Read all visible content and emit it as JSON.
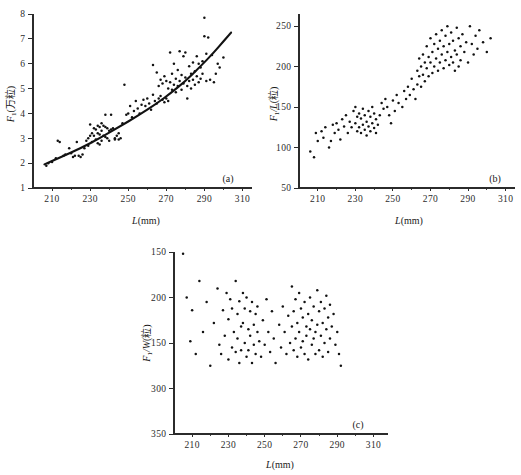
{
  "figure": {
    "background": "#ffffff",
    "ink_color": "#121212",
    "panels": [
      "a",
      "b",
      "c"
    ]
  },
  "chart_data": [
    {
      "type": "scatter",
      "panel_label": "(a)",
      "title": "",
      "xlabel": "L(mm)",
      "ylabel": "F₁(万粒)",
      "xlim": [
        200,
        315
      ],
      "ylim": [
        1,
        8
      ],
      "xticks": [
        210,
        230,
        250,
        270,
        290,
        310
      ],
      "yticks": [
        1,
        2,
        3,
        4,
        5,
        6,
        7,
        8
      ],
      "grid": false,
      "legend": "none",
      "has_fit_curve": true,
      "fit_curve_description": "monotonic increasing convex curve from about (206, 1.95) to (304, 7.25)",
      "fit_curve_points": [
        [
          206,
          1.95
        ],
        [
          215,
          2.25
        ],
        [
          225,
          2.6
        ],
        [
          235,
          3.0
        ],
        [
          245,
          3.45
        ],
        [
          255,
          3.9
        ],
        [
          265,
          4.4
        ],
        [
          272,
          4.8
        ],
        [
          280,
          5.3
        ],
        [
          288,
          5.9
        ],
        [
          295,
          6.45
        ],
        [
          300,
          6.9
        ],
        [
          304,
          7.25
        ]
      ],
      "x": [
        207,
        208,
        210,
        212,
        213,
        214,
        216,
        217,
        219,
        220,
        221,
        222,
        223,
        224,
        225,
        226,
        227,
        228,
        229,
        229,
        230,
        230,
        231,
        231,
        232,
        232,
        233,
        233,
        234,
        234,
        234,
        235,
        235,
        235,
        236,
        236,
        236,
        237,
        237,
        238,
        238,
        238,
        239,
        239,
        240,
        240,
        241,
        241,
        242,
        243,
        243,
        244,
        245,
        245,
        246,
        247,
        248,
        249,
        250,
        251,
        252,
        253,
        254,
        255,
        256,
        257,
        258,
        259,
        260,
        261,
        262,
        263,
        263,
        264,
        265,
        265,
        266,
        266,
        267,
        267,
        268,
        268,
        269,
        269,
        270,
        270,
        271,
        271,
        272,
        272,
        273,
        273,
        274,
        274,
        275,
        275,
        276,
        276,
        277,
        277,
        278,
        278,
        279,
        279,
        280,
        280,
        281,
        281,
        282,
        282,
        283,
        283,
        284,
        284,
        285,
        285,
        286,
        286,
        287,
        287,
        288,
        288,
        289,
        289,
        290,
        290,
        291,
        291,
        292,
        293,
        294,
        295,
        296,
        297,
        298,
        300
      ],
      "y": [
        1.9,
        2.0,
        2.05,
        2.2,
        2.9,
        2.85,
        2.3,
        2.35,
        2.6,
        2.4,
        2.25,
        2.3,
        2.85,
        2.3,
        2.25,
        2.35,
        2.6,
        2.9,
        3.0,
        2.7,
        3.55,
        3.1,
        3.2,
        2.85,
        3.4,
        3.1,
        3.35,
        2.95,
        3.5,
        3.2,
        2.8,
        3.45,
        3.15,
        2.75,
        3.6,
        3.3,
        2.9,
        3.5,
        3.1,
        3.95,
        3.45,
        3.05,
        3.4,
        3.0,
        3.3,
        2.9,
        3.95,
        3.35,
        3.4,
        3.0,
        2.95,
        3.1,
        3.2,
        2.95,
        3.0,
        3.6,
        5.15,
        3.95,
        4.0,
        4.3,
        3.85,
        4.1,
        4.5,
        4.2,
        4.0,
        4.35,
        4.55,
        4.3,
        4.6,
        4.4,
        4.15,
        5.95,
        4.75,
        4.5,
        5.65,
        4.4,
        5.1,
        4.6,
        5.35,
        4.7,
        5.2,
        4.55,
        5.5,
        4.45,
        5.3,
        4.6,
        5.0,
        4.5,
        6.45,
        5.25,
        5.6,
        4.95,
        6.0,
        5.15,
        5.4,
        4.85,
        5.75,
        5.1,
        6.5,
        5.3,
        5.55,
        4.95,
        6.3,
        5.2,
        6.45,
        5.45,
        5.1,
        4.6,
        5.9,
        5.3,
        5.6,
        5.0,
        6.05,
        5.35,
        5.7,
        5.15,
        6.3,
        5.5,
        6.0,
        5.25,
        5.85,
        5.4,
        6.1,
        5.6,
        7.85,
        7.1,
        6.4,
        5.3,
        7.05,
        5.35,
        6.35,
        5.25,
        5.6,
        6.0,
        5.85,
        6.25
      ]
    },
    {
      "type": "scatter",
      "panel_label": "(b)",
      "title": "",
      "xlabel": "L(mm)",
      "ylabel": "F₁/L(粒)",
      "xlim": [
        200,
        315
      ],
      "ylim": [
        50,
        265
      ],
      "xticks": [
        210,
        230,
        250,
        270,
        290,
        310
      ],
      "yticks": [
        50,
        100,
        150,
        200,
        250
      ],
      "grid": false,
      "legend": "none",
      "has_fit_curve": false,
      "cluster_description": "two loose clusters: lower-left around L=225-245, and a dense upper-right cluster around L=270-290",
      "x": [
        206,
        208,
        209,
        210,
        212,
        213,
        214,
        216,
        217,
        218,
        219,
        220,
        221,
        222,
        223,
        224,
        225,
        226,
        227,
        228,
        229,
        230,
        230,
        231,
        231,
        232,
        232,
        233,
        233,
        234,
        234,
        235,
        235,
        236,
        236,
        237,
        237,
        238,
        238,
        239,
        239,
        240,
        240,
        241,
        241,
        242,
        243,
        244,
        245,
        246,
        247,
        248,
        249,
        250,
        251,
        252,
        253,
        255,
        256,
        257,
        258,
        259,
        260,
        261,
        262,
        263,
        263,
        264,
        264,
        265,
        265,
        266,
        266,
        267,
        267,
        268,
        268,
        269,
        269,
        270,
        270,
        271,
        271,
        272,
        272,
        273,
        273,
        274,
        274,
        275,
        275,
        276,
        276,
        277,
        277,
        278,
        278,
        279,
        279,
        280,
        280,
        281,
        281,
        282,
        282,
        283,
        283,
        284,
        284,
        285,
        285,
        286,
        286,
        287,
        288,
        289,
        290,
        291,
        292,
        293,
        294,
        295,
        296,
        298,
        300,
        302
      ],
      "y": [
        95,
        88,
        118,
        108,
        120,
        112,
        125,
        100,
        108,
        128,
        118,
        130,
        122,
        110,
        135,
        126,
        140,
        118,
        132,
        125,
        145,
        150,
        130,
        138,
        120,
        142,
        125,
        136,
        118,
        148,
        128,
        140,
        122,
        132,
        115,
        145,
        126,
        138,
        120,
        150,
        130,
        142,
        124,
        135,
        118,
        128,
        140,
        155,
        148,
        160,
        150,
        140,
        130,
        158,
        145,
        165,
        155,
        150,
        170,
        160,
        175,
        165,
        185,
        172,
        160,
        195,
        178,
        210,
        188,
        200,
        175,
        215,
        190,
        205,
        182,
        225,
        198,
        212,
        188,
        235,
        205,
        218,
        192,
        228,
        200,
        240,
        210,
        222,
        195,
        232,
        205,
        245,
        215,
        225,
        198,
        238,
        208,
        250,
        218,
        228,
        202,
        242,
        212,
        232,
        205,
        220,
        195,
        248,
        215,
        235,
        200,
        225,
        208,
        240,
        218,
        230,
        205,
        250,
        228,
        215,
        238,
        222,
        245,
        230,
        218,
        235
      ]
    },
    {
      "type": "scatter",
      "panel_label": "(c)",
      "title": "",
      "xlabel": "L(mm)",
      "ylabel": "F₁/W(粒)",
      "xlim": [
        200,
        318
      ],
      "ylim": [
        150,
        350
      ],
      "xticks": [
        210,
        230,
        250,
        270,
        290,
        310
      ],
      "yticks": [
        150,
        200,
        150,
        300,
        350
      ],
      "ytick_labels_as_printed": [
        "350",
        "300",
        "150",
        "200",
        "150"
      ],
      "grid": false,
      "legend": "none",
      "has_fit_curve": false,
      "cluster_description": "no visible trend; points spread across L=205-292 with two denser bands around 230-250 and 265-290",
      "x": [
        205,
        207,
        209,
        210,
        212,
        214,
        216,
        218,
        220,
        222,
        224,
        225,
        226,
        227,
        228,
        229,
        230,
        230,
        231,
        232,
        232,
        233,
        234,
        234,
        235,
        235,
        236,
        236,
        237,
        237,
        238,
        238,
        239,
        239,
        240,
        240,
        241,
        241,
        242,
        242,
        243,
        243,
        244,
        244,
        245,
        245,
        246,
        246,
        247,
        248,
        249,
        250,
        251,
        252,
        253,
        254,
        255,
        256,
        258,
        259,
        260,
        261,
        262,
        263,
        264,
        265,
        265,
        266,
        266,
        267,
        267,
        268,
        268,
        269,
        269,
        270,
        270,
        271,
        271,
        272,
        272,
        273,
        273,
        274,
        274,
        275,
        275,
        276,
        276,
        277,
        277,
        278,
        278,
        279,
        279,
        280,
        280,
        281,
        281,
        282,
        282,
        283,
        283,
        284,
        284,
        285,
        285,
        286,
        286,
        287,
        288,
        289,
        290,
        291,
        292
      ],
      "y": [
        348,
        300,
        252,
        286,
        238,
        318,
        262,
        295,
        225,
        272,
        310,
        248,
        238,
        286,
        258,
        305,
        232,
        276,
        298,
        245,
        288,
        262,
        318,
        240,
        282,
        255,
        296,
        228,
        268,
        242,
        305,
        272,
        250,
        288,
        235,
        300,
        265,
        242,
        285,
        258,
        228,
        295,
        270,
        248,
        282,
        238,
        262,
        290,
        252,
        235,
        275,
        248,
        298,
        262,
        240,
        285,
        255,
        228,
        270,
        245,
        290,
        262,
        238,
        280,
        250,
        312,
        268,
        285,
        242,
        298,
        255,
        272,
        235,
        305,
        262,
        288,
        245,
        278,
        252,
        295,
        238,
        268,
        258,
        282,
        232,
        300,
        265,
        275,
        248,
        290,
        255,
        262,
        238,
        308,
        270,
        285,
        242,
        295,
        258,
        272,
        235,
        288,
        250,
        302,
        265,
        278,
        240,
        292,
        255,
        268,
        282,
        248,
        262,
        238,
        225
      ]
    }
  ]
}
